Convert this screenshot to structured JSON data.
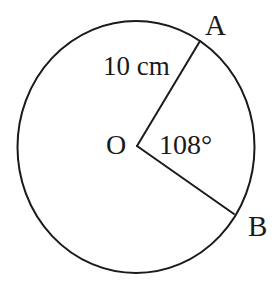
{
  "diagram": {
    "type": "circle-sector",
    "labels": {
      "point_a": "A",
      "point_b": "B",
      "center": "O",
      "radius": "10 cm",
      "angle": "108°"
    },
    "geometry": {
      "center": {
        "x": 137,
        "y": 146
      },
      "rx": 118,
      "ry": 126,
      "point_a": {
        "x": 200,
        "y": 41
      },
      "point_b": {
        "x": 234,
        "y": 214
      }
    },
    "colors": {
      "stroke": "#1a1a1a",
      "background": "#ffffff"
    }
  }
}
